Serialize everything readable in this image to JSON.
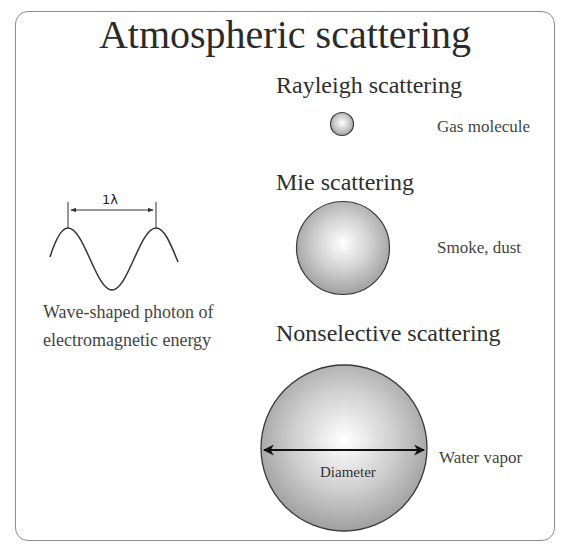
{
  "title": "Atmospheric scattering",
  "photon": {
    "wavelength_label": "1λ",
    "caption_line1": "Wave-shaped photon of",
    "caption_line2": "electromagnetic energy"
  },
  "sections": [
    {
      "heading": "Rayleigh scattering",
      "particle_label": "Gas molecule",
      "particle_size": "small"
    },
    {
      "heading": "Mie scattering",
      "particle_label": "Smoke, dust",
      "particle_size": "medium"
    },
    {
      "heading": "Nonselective scattering",
      "particle_label": "Water vapor",
      "particle_size": "large",
      "diameter_label": "Diameter"
    }
  ],
  "colors": {
    "frame": "#8c8c8c",
    "sphere_highlight": "#ffffff",
    "sphere_shadow": "#9a9a9a",
    "sphere_outline": "#3a3a3a",
    "text": "#333333"
  }
}
